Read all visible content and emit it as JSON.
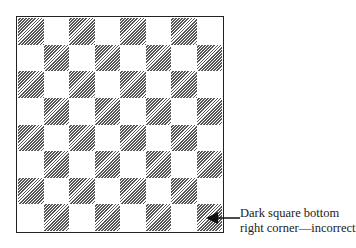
{
  "board": {
    "rows": 8,
    "cols": 8,
    "top_left": "dark",
    "bottom_right": "dark",
    "dark_style": "diagonal-hatch",
    "dark_color": "#555555",
    "light_color": "#ffffff",
    "border_color": "#222222"
  },
  "annotation": {
    "line1": "Dark square bottom",
    "line2": "right corner—incorrect",
    "target": "bottom-right square"
  }
}
